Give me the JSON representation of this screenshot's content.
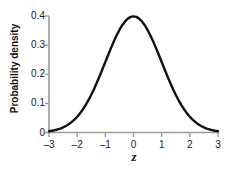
{
  "chart_data": {
    "type": "line",
    "title": "",
    "subtitle": "",
    "xlabel": "z",
    "ylabel": "Probability density",
    "xlim": [
      -3,
      3
    ],
    "ylim": [
      0,
      0.4
    ],
    "grid": false,
    "legend": null,
    "annotations": [],
    "curve_color": "#111111",
    "axis_color": "#9a9a9a",
    "background_color": "#ffffff",
    "x_ticks": [
      {
        "value": -3,
        "label": "–3"
      },
      {
        "value": -2,
        "label": "–2"
      },
      {
        "value": -1,
        "label": "–1"
      },
      {
        "value": 0,
        "label": "0"
      },
      {
        "value": 1,
        "label": "1"
      },
      {
        "value": 2,
        "label": "2"
      },
      {
        "value": 3,
        "label": "3"
      }
    ],
    "y_ticks": [
      {
        "value": 0.4,
        "label": "0.4"
      },
      {
        "value": 0.3,
        "label": "0.3"
      },
      {
        "value": 0.2,
        "label": "0.2"
      },
      {
        "value": 0.1,
        "label": "0.1"
      },
      {
        "value": 0,
        "label": "0"
      }
    ],
    "series": [
      {
        "name": "standard normal density",
        "x": [
          -3,
          -2.9,
          -2.8,
          -2.7,
          -2.6,
          -2.5,
          -2.4,
          -2.3,
          -2.2,
          -2.1,
          -2,
          -1.9,
          -1.8,
          -1.7,
          -1.6,
          -1.5,
          -1.4,
          -1.3,
          -1.2,
          -1.1,
          -1,
          -0.9,
          -0.8,
          -0.7,
          -0.6,
          -0.5,
          -0.4,
          -0.3,
          -0.2,
          -0.1,
          0,
          0.1,
          0.2,
          0.3,
          0.4,
          0.5,
          0.6,
          0.7,
          0.8,
          0.9,
          1,
          1.1,
          1.2,
          1.3,
          1.4,
          1.5,
          1.6,
          1.7,
          1.8,
          1.9,
          2,
          2.1,
          2.2,
          2.3,
          2.4,
          2.5,
          2.6,
          2.7,
          2.8,
          2.9,
          3
        ],
        "values": [
          0.0044,
          0.006,
          0.0079,
          0.0104,
          0.0136,
          0.0175,
          0.0224,
          0.0283,
          0.0355,
          0.044,
          0.054,
          0.0656,
          0.079,
          0.094,
          0.1109,
          0.1295,
          0.1497,
          0.1714,
          0.1942,
          0.2179,
          0.242,
          0.2661,
          0.2897,
          0.3123,
          0.3332,
          0.3521,
          0.3683,
          0.3814,
          0.391,
          0.397,
          0.3989,
          0.397,
          0.391,
          0.3814,
          0.3683,
          0.3521,
          0.3332,
          0.3123,
          0.2897,
          0.2661,
          0.242,
          0.2179,
          0.1942,
          0.1714,
          0.1497,
          0.1295,
          0.1109,
          0.094,
          0.079,
          0.0656,
          0.054,
          0.044,
          0.0355,
          0.0283,
          0.0224,
          0.0175,
          0.0136,
          0.0104,
          0.0079,
          0.006,
          0.0044
        ]
      }
    ]
  }
}
